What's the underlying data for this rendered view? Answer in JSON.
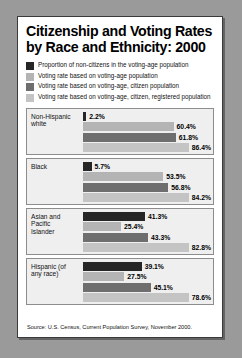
{
  "title_lines": [
    "Citizenship and Voting Rates",
    "by Race and Ethnicity: 2000"
  ],
  "legend": [
    {
      "label": "Proportion of non-citizens in the voting-age population",
      "color": "#262626"
    },
    {
      "label": "Voting rate based on voting-age population",
      "color": "#b4b4b4"
    },
    {
      "label": "Voting rate based on voting-age, citizen population",
      "color": "#6e6e6e"
    },
    {
      "label": "Voting rate based on voting-age, citizen, registered population",
      "color": "#c4c4c4"
    }
  ],
  "source": "Source: U.S. Census, Current Population Survey, November 2000.",
  "chart_data": {
    "type": "bar",
    "title": "Citizenship and Voting Rates by Race and Ethnicity: 2000",
    "xlabel": "",
    "ylabel": "",
    "xlim": [
      0,
      100
    ],
    "grid": false,
    "legend_position": "top",
    "orientation": "horizontal",
    "categories": [
      "Non-Hispanic white",
      "Black",
      "Asian and Pacific Islander",
      "Hispanic (of any race)"
    ],
    "series": [
      {
        "name": "Proportion of non-citizens in the voting-age population",
        "color": "#262626",
        "values": [
          2.2,
          5.7,
          41.3,
          39.1
        ]
      },
      {
        "name": "Voting rate based on voting-age population",
        "color": "#b4b4b4",
        "values": [
          60.4,
          53.5,
          25.4,
          27.5
        ]
      },
      {
        "name": "Voting rate based on voting-age, citizen population",
        "color": "#6e6e6e",
        "values": [
          61.8,
          56.8,
          43.3,
          45.1
        ]
      },
      {
        "name": "Voting rate based on voting-age, citizen, registered population",
        "color": "#c4c4c4",
        "values": [
          86.4,
          84.2,
          82.8,
          78.6
        ]
      }
    ],
    "groups": [
      {
        "label_lines": [
          "Non-Hispanic",
          "white"
        ],
        "bars": [
          {
            "value": 2.2,
            "value_label": "2.2%",
            "color": "#262626"
          },
          {
            "value": 60.4,
            "value_label": "60.4%",
            "color": "#b4b4b4"
          },
          {
            "value": 61.8,
            "value_label": "61.8%",
            "color": "#6e6e6e"
          },
          {
            "value": 86.4,
            "value_label": "86.4%",
            "color": "#c4c4c4"
          }
        ]
      },
      {
        "label_lines": [
          "Black"
        ],
        "bars": [
          {
            "value": 5.7,
            "value_label": "5.7%",
            "color": "#262626"
          },
          {
            "value": 53.5,
            "value_label": "53.5%",
            "color": "#b4b4b4"
          },
          {
            "value": 56.8,
            "value_label": "56.8%",
            "color": "#6e6e6e"
          },
          {
            "value": 84.2,
            "value_label": "84.2%",
            "color": "#c4c4c4"
          }
        ]
      },
      {
        "label_lines": [
          "Asian and",
          "Pacific",
          "Islander"
        ],
        "bars": [
          {
            "value": 41.3,
            "value_label": "41.3%",
            "color": "#262626"
          },
          {
            "value": 25.4,
            "value_label": "25.4%",
            "color": "#b4b4b4"
          },
          {
            "value": 43.3,
            "value_label": "43.3%",
            "color": "#6e6e6e"
          },
          {
            "value": 82.8,
            "value_label": "82.8%",
            "color": "#c4c4c4"
          }
        ]
      },
      {
        "label_lines": [
          "Hispanic (of",
          "any race)"
        ],
        "bars": [
          {
            "value": 39.1,
            "value_label": "39.1%",
            "color": "#262626"
          },
          {
            "value": 27.5,
            "value_label": "27.5%",
            "color": "#b4b4b4"
          },
          {
            "value": 45.1,
            "value_label": "45.1%",
            "color": "#6e6e6e"
          },
          {
            "value": 78.6,
            "value_label": "78.6%",
            "color": "#c4c4c4"
          }
        ]
      }
    ]
  }
}
